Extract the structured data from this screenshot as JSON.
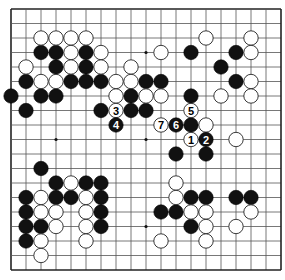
{
  "diagram": {
    "type": "go-board",
    "size": 19,
    "colors": {
      "black": "#111111",
      "white": "#ffffff",
      "line": "#555555",
      "edge": "#222222",
      "background": "#ffffff"
    },
    "star_points": [
      [
        3,
        3
      ],
      [
        9,
        3
      ],
      [
        15,
        3
      ],
      [
        3,
        9
      ],
      [
        9,
        9
      ],
      [
        15,
        9
      ],
      [
        3,
        15
      ],
      [
        9,
        15
      ],
      [
        15,
        15
      ]
    ],
    "black_stones": [
      [
        2,
        3
      ],
      [
        3,
        3
      ],
      [
        5,
        3
      ],
      [
        12,
        3
      ],
      [
        15,
        3
      ],
      [
        3,
        4
      ],
      [
        5,
        4
      ],
      [
        14,
        4
      ],
      [
        1,
        5
      ],
      [
        4,
        5
      ],
      [
        5,
        5
      ],
      [
        6,
        5
      ],
      [
        9,
        5
      ],
      [
        10,
        5
      ],
      [
        15,
        5
      ],
      [
        0,
        6
      ],
      [
        2,
        6
      ],
      [
        3,
        6
      ],
      [
        8,
        6
      ],
      [
        12,
        6
      ],
      [
        1,
        7
      ],
      [
        6,
        7
      ],
      [
        8,
        7
      ],
      [
        9,
        7
      ],
      [
        12,
        8
      ],
      [
        11,
        10
      ],
      [
        13,
        10
      ],
      [
        2,
        11
      ],
      [
        3,
        12
      ],
      [
        5,
        12
      ],
      [
        6,
        12
      ],
      [
        1,
        13
      ],
      [
        3,
        13
      ],
      [
        4,
        13
      ],
      [
        6,
        13
      ],
      [
        12,
        13
      ],
      [
        13,
        13
      ],
      [
        15,
        13
      ],
      [
        16,
        13
      ],
      [
        1,
        14
      ],
      [
        6,
        14
      ],
      [
        10,
        14
      ],
      [
        11,
        14
      ],
      [
        1,
        15
      ],
      [
        2,
        15
      ],
      [
        6,
        15
      ],
      [
        12,
        15
      ],
      [
        1,
        16
      ]
    ],
    "white_stones": [
      [
        2,
        2
      ],
      [
        3,
        2
      ],
      [
        4,
        2
      ],
      [
        5,
        2
      ],
      [
        13,
        2
      ],
      [
        16,
        2
      ],
      [
        4,
        3
      ],
      [
        6,
        3
      ],
      [
        10,
        3
      ],
      [
        16,
        3
      ],
      [
        1,
        4
      ],
      [
        4,
        4
      ],
      [
        6,
        4
      ],
      [
        8,
        4
      ],
      [
        2,
        5
      ],
      [
        3,
        5
      ],
      [
        7,
        5
      ],
      [
        8,
        5
      ],
      [
        16,
        5
      ],
      [
        7,
        6
      ],
      [
        9,
        6
      ],
      [
        10,
        6
      ],
      [
        14,
        6
      ],
      [
        16,
        6
      ],
      [
        13,
        8
      ],
      [
        15,
        9
      ],
      [
        4,
        12
      ],
      [
        11,
        12
      ],
      [
        2,
        13
      ],
      [
        5,
        13
      ],
      [
        11,
        13
      ],
      [
        2,
        14
      ],
      [
        3,
        14
      ],
      [
        5,
        14
      ],
      [
        12,
        14
      ],
      [
        13,
        14
      ],
      [
        16,
        14
      ],
      [
        3,
        15
      ],
      [
        5,
        15
      ],
      [
        13,
        15
      ],
      [
        15,
        15
      ],
      [
        2,
        16
      ],
      [
        5,
        16
      ],
      [
        10,
        16
      ],
      [
        13,
        16
      ],
      [
        2,
        17
      ]
    ],
    "numbered_moves": [
      {
        "n": "1",
        "color": "white",
        "col": 12,
        "row": 9
      },
      {
        "n": "2",
        "color": "black",
        "col": 13,
        "row": 9
      },
      {
        "n": "3",
        "color": "white",
        "col": 7,
        "row": 7
      },
      {
        "n": "4",
        "color": "black",
        "col": 7,
        "row": 8
      },
      {
        "n": "5",
        "color": "white",
        "col": 12,
        "row": 7
      },
      {
        "n": "6",
        "color": "black",
        "col": 11,
        "row": 8
      },
      {
        "n": "7",
        "color": "white",
        "col": 10,
        "row": 8
      }
    ]
  }
}
